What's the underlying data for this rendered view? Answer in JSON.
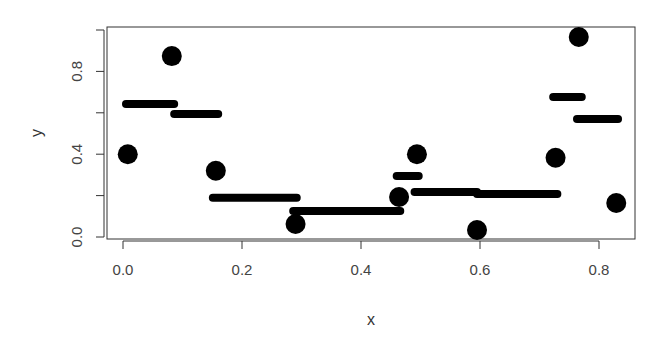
{
  "chart_data": {
    "type": "scatter",
    "title": "",
    "xlabel": "x",
    "ylabel": "y",
    "xlim": [
      -0.03,
      0.86
    ],
    "ylim": [
      -0.01,
      1.02
    ],
    "x_ticks": [
      0.0,
      0.2,
      0.4,
      0.6,
      0.8
    ],
    "x_tick_labels": [
      "0.0",
      "0.2",
      "0.4",
      "0.6",
      "0.8"
    ],
    "y_ticks": [
      0.0,
      0.2,
      0.4,
      0.6,
      0.8,
      1.0
    ],
    "y_tick_labels": [
      "0.0",
      "",
      "0.4",
      "",
      "0.8",
      ""
    ],
    "grid": false,
    "legend": null,
    "series": [
      {
        "name": "points",
        "kind": "scatter",
        "marker": "filled-circle",
        "color": "#000000",
        "x": [
          0.008,
          0.082,
          0.156,
          0.29,
          0.464,
          0.494,
          0.595,
          0.727,
          0.766,
          0.829
        ],
        "y": [
          0.4,
          0.874,
          0.32,
          0.063,
          0.193,
          0.4,
          0.034,
          0.383,
          0.966,
          0.164
        ]
      },
      {
        "name": "step-fit",
        "kind": "horizontal-segments",
        "color": "#000000",
        "segments": [
          {
            "x0": 0.005,
            "x1": 0.086,
            "y": 0.643
          },
          {
            "x0": 0.086,
            "x1": 0.16,
            "y": 0.594
          },
          {
            "x0": 0.151,
            "x1": 0.292,
            "y": 0.19
          },
          {
            "x0": 0.286,
            "x1": 0.466,
            "y": 0.126
          },
          {
            "x0": 0.46,
            "x1": 0.497,
            "y": 0.295
          },
          {
            "x0": 0.49,
            "x1": 0.595,
            "y": 0.217
          },
          {
            "x0": 0.595,
            "x1": 0.73,
            "y": 0.208
          },
          {
            "x0": 0.723,
            "x1": 0.771,
            "y": 0.676
          },
          {
            "x0": 0.763,
            "x1": 0.832,
            "y": 0.57
          }
        ]
      }
    ]
  }
}
